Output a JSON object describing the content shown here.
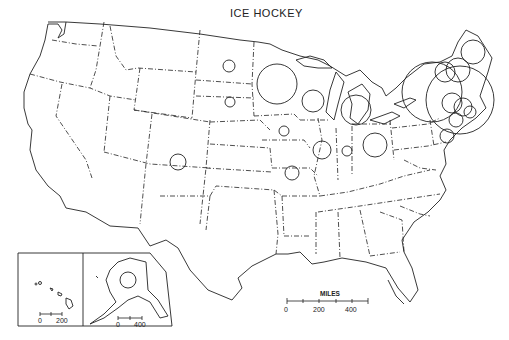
{
  "title": "ICE HOCKEY",
  "colors": {
    "ink": "#222222",
    "background": "#ffffff"
  },
  "scale_bar": {
    "label": "MILES",
    "ticks": [
      "0",
      "200",
      "400"
    ]
  },
  "inset_hawaii": {
    "scale_ticks": [
      "0",
      "200"
    ]
  },
  "inset_alaska": {
    "scale_ticks": [
      "0",
      "400"
    ]
  },
  "circles": [
    {
      "region": "North Dakota",
      "x": 229,
      "y": 66,
      "r": 6
    },
    {
      "region": "South Dakota",
      "x": 230,
      "y": 102,
      "r": 5
    },
    {
      "region": "Minnesota",
      "x": 277,
      "y": 84,
      "r": 20
    },
    {
      "region": "Wisconsin",
      "x": 313,
      "y": 101,
      "r": 11
    },
    {
      "region": "Michigan",
      "x": 356,
      "y": 110,
      "r": 15
    },
    {
      "region": "Iowa",
      "x": 284,
      "y": 131,
      "r": 5
    },
    {
      "region": "Illinois",
      "x": 322,
      "y": 150,
      "r": 9
    },
    {
      "region": "Indiana",
      "x": 347,
      "y": 151,
      "r": 5
    },
    {
      "region": "Ohio",
      "x": 375,
      "y": 145,
      "r": 12
    },
    {
      "region": "Missouri",
      "x": 292,
      "y": 173,
      "r": 7
    },
    {
      "region": "Colorado",
      "x": 178,
      "y": 162,
      "r": 8
    },
    {
      "region": "Alaska",
      "x": 128,
      "y": 280,
      "r": 8
    },
    {
      "region": "Maine",
      "x": 473,
      "y": 52,
      "r": 12
    },
    {
      "region": "New York",
      "x": 432,
      "y": 92,
      "r": 30
    },
    {
      "region": "Northeast large",
      "x": 460,
      "y": 100,
      "r": 34
    },
    {
      "region": "Vermont",
      "x": 445,
      "y": 72,
      "r": 10
    },
    {
      "region": "New Hampshire",
      "x": 458,
      "y": 70,
      "r": 12
    },
    {
      "region": "Massachusetts A",
      "x": 452,
      "y": 103,
      "r": 10
    },
    {
      "region": "Massachusetts B",
      "x": 463,
      "y": 107,
      "r": 9
    },
    {
      "region": "Connecticut",
      "x": 456,
      "y": 120,
      "r": 7
    },
    {
      "region": "Rhode Island",
      "x": 470,
      "y": 112,
      "r": 6
    },
    {
      "region": "New Jersey",
      "x": 447,
      "y": 136,
      "r": 7
    }
  ]
}
